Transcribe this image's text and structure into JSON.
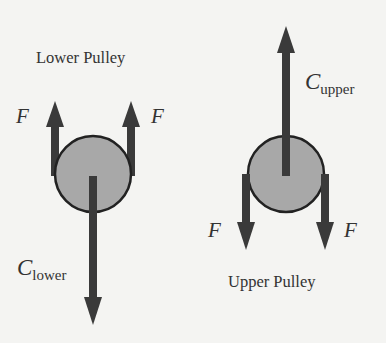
{
  "diagram": {
    "type": "free-body diagram",
    "colors": {
      "background": "#f4f4f2",
      "pulley_fill": "#a8a8a8",
      "outline": "#222222",
      "arrow": "#3a3a3a",
      "text": "#333333"
    },
    "lower_pulley": {
      "title": "Lower Pulley",
      "forces": [
        {
          "label": "F",
          "direction": "up",
          "position": "left"
        },
        {
          "label": "F",
          "direction": "up",
          "position": "right"
        },
        {
          "label_main": "C",
          "label_sub": "lower",
          "direction": "down",
          "position": "center"
        }
      ]
    },
    "upper_pulley": {
      "title": "Upper Pulley",
      "forces": [
        {
          "label_main": "C",
          "label_sub": "upper",
          "direction": "up",
          "position": "center"
        },
        {
          "label": "F",
          "direction": "down",
          "position": "left"
        },
        {
          "label": "F",
          "direction": "down",
          "position": "right"
        }
      ]
    }
  }
}
